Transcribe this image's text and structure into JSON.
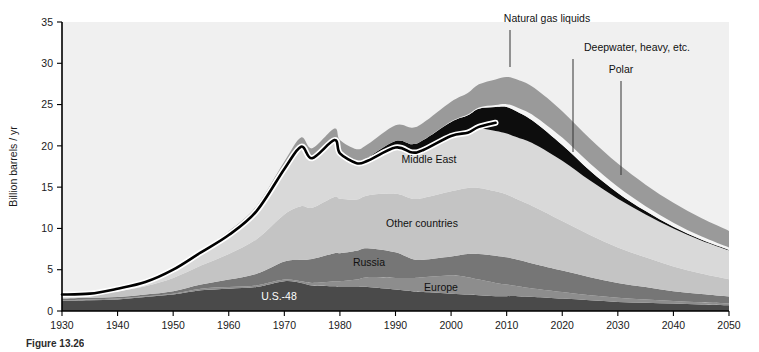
{
  "figure": {
    "caption_prefix": "Figure",
    "caption_number": "13.26",
    "y_axis_title": "Billion barrels / yr"
  },
  "chart_data": {
    "type": "area",
    "title": "",
    "subtitle": "",
    "xlabel": "",
    "ylabel": "Billion barrels / yr",
    "xlim": [
      1930,
      2050
    ],
    "ylim": [
      0,
      35
    ],
    "grid": false,
    "legend_position": "in-plot annotations",
    "stacked": true,
    "xticks": [
      1930,
      1940,
      1950,
      1960,
      1970,
      1980,
      1990,
      2000,
      2010,
      2020,
      2030,
      2040,
      2050
    ],
    "yticks": [
      0,
      5,
      10,
      15,
      20,
      25,
      30,
      35
    ],
    "x": [
      1930,
      1935,
      1940,
      1945,
      1950,
      1955,
      1960,
      1965,
      1970,
      1973,
      1975,
      1979,
      1980,
      1983,
      1985,
      1990,
      1993,
      1995,
      2000,
      2003,
      2005,
      2008,
      2010,
      2012,
      2015,
      2020,
      2025,
      2030,
      2035,
      2040,
      2045,
      2050
    ],
    "series": [
      {
        "name": "U.S.-48",
        "color": "#4a4a4a",
        "values": [
          1.2,
          1.3,
          1.4,
          1.7,
          2.0,
          2.5,
          2.7,
          2.9,
          3.6,
          3.4,
          3.1,
          3.0,
          2.9,
          2.9,
          2.9,
          2.6,
          2.4,
          2.3,
          2.1,
          2.0,
          1.9,
          1.8,
          1.8,
          1.8,
          1.7,
          1.5,
          1.3,
          1.1,
          1.0,
          0.9,
          0.8,
          0.7
        ]
      },
      {
        "name": "Europe",
        "color": "#8d8d8d",
        "values": [
          0.1,
          0.1,
          0.1,
          0.1,
          0.1,
          0.2,
          0.2,
          0.2,
          0.2,
          0.2,
          0.3,
          0.6,
          0.7,
          0.9,
          1.2,
          1.4,
          1.6,
          1.8,
          2.2,
          2.1,
          1.9,
          1.6,
          1.4,
          1.2,
          1.0,
          0.8,
          0.6,
          0.5,
          0.4,
          0.3,
          0.25,
          0.2
        ]
      },
      {
        "name": "Russia",
        "color": "#767676",
        "values": [
          0.2,
          0.2,
          0.2,
          0.2,
          0.3,
          0.5,
          0.9,
          1.4,
          2.2,
          2.6,
          2.9,
          3.4,
          3.4,
          3.5,
          3.5,
          3.1,
          2.3,
          2.1,
          2.3,
          2.8,
          3.1,
          3.3,
          3.3,
          3.2,
          3.0,
          2.6,
          2.2,
          1.8,
          1.5,
          1.2,
          1.0,
          0.85
        ]
      },
      {
        "name": "Other countries",
        "color": "#c4c4c4",
        "values": [
          0.4,
          0.5,
          0.7,
          1.0,
          1.6,
          2.3,
          3.1,
          4.2,
          5.7,
          6.5,
          6.2,
          6.8,
          6.6,
          6.2,
          6.4,
          7.1,
          7.3,
          7.5,
          7.9,
          8.0,
          8.0,
          7.8,
          7.6,
          7.3,
          6.9,
          6.0,
          5.1,
          4.3,
          3.6,
          3.0,
          2.5,
          2.1
        ]
      },
      {
        "name": "Middle East",
        "color": "#d9d9d9",
        "values": [
          0.1,
          0.2,
          0.3,
          0.5,
          1.0,
          1.6,
          2.3,
          3.4,
          5.5,
          7.2,
          6.0,
          6.8,
          5.5,
          4.4,
          4.2,
          5.6,
          5.6,
          5.8,
          6.7,
          6.7,
          7.2,
          7.3,
          7.4,
          7.5,
          7.6,
          7.3,
          6.6,
          5.9,
          5.2,
          4.6,
          4.0,
          3.5
        ]
      },
      {
        "name": "Deepwater, heavy, etc.",
        "color": "#0d0d0d",
        "values": [
          0,
          0,
          0,
          0,
          0,
          0,
          0,
          0,
          0,
          0,
          0,
          0,
          0.1,
          0.2,
          0.4,
          0.8,
          1.0,
          1.2,
          1.7,
          2.1,
          2.4,
          2.9,
          3.2,
          3.1,
          2.7,
          1.9,
          1.2,
          0.7,
          0.4,
          0.2,
          0.1,
          0.05
        ]
      },
      {
        "name": "Polar",
        "color": "#f5f5f5",
        "values": [
          0,
          0,
          0,
          0,
          0,
          0,
          0,
          0,
          0,
          0,
          0,
          0,
          0,
          0,
          0,
          0,
          0,
          0,
          0.05,
          0.1,
          0.15,
          0.25,
          0.35,
          0.5,
          0.7,
          0.9,
          0.85,
          0.75,
          0.6,
          0.5,
          0.4,
          0.3
        ]
      },
      {
        "name": "Natural gas liquids",
        "color": "#9a9a9a",
        "values": [
          0.05,
          0.05,
          0.1,
          0.15,
          0.2,
          0.3,
          0.45,
          0.6,
          0.9,
          1.1,
          1.2,
          1.5,
          1.5,
          1.5,
          1.6,
          1.9,
          2.0,
          2.1,
          2.4,
          2.6,
          2.8,
          3.1,
          3.3,
          3.4,
          3.4,
          3.2,
          3.0,
          2.8,
          2.6,
          2.4,
          2.2,
          2.0
        ]
      }
    ],
    "history_line": {
      "name": "Historical conventional oil production",
      "color": "#000000",
      "x": [
        1930,
        1935,
        1940,
        1945,
        1950,
        1955,
        1960,
        1965,
        1970,
        1973,
        1975,
        1979,
        1980,
        1983,
        1985,
        1990,
        1993,
        1995,
        2000,
        2003,
        2005,
        2008
      ],
      "values": [
        2.0,
        2.1,
        2.7,
        3.5,
        5.0,
        7.1,
        9.2,
        12.1,
        17.2,
        19.9,
        18.5,
        20.7,
        19.1,
        17.9,
        18.2,
        19.8,
        19.2,
        19.5,
        21.2,
        21.6,
        22.3,
        22.8
      ]
    },
    "annotations": [
      {
        "text": "Natural gas liquids",
        "type": "callout",
        "x": 2011,
        "label_xy": [
          547,
          22
        ],
        "leader_from": [
          510,
          30
        ],
        "leader_to": [
          510,
          67
        ]
      },
      {
        "text": "Deepwater, heavy, etc.",
        "type": "callout",
        "x": 2020,
        "label_xy": [
          637,
          51
        ],
        "leader_from": [
          573,
          59
        ],
        "leader_to": [
          573,
          152
        ]
      },
      {
        "text": "Polar",
        "type": "callout",
        "x": 2030,
        "label_xy": [
          621,
          73
        ],
        "leader_from": [
          621,
          81
        ],
        "leader_to": [
          621,
          175
        ]
      },
      {
        "text": "Middle East",
        "type": "inline",
        "label_xy": [
          429,
          163
        ]
      },
      {
        "text": "Other countries",
        "type": "inline",
        "label_xy": [
          422,
          227
        ]
      },
      {
        "text": "Russia",
        "type": "inline",
        "label_xy": [
          369,
          266
        ]
      },
      {
        "text": "Europe",
        "type": "inline",
        "label_xy": [
          441,
          291
        ]
      },
      {
        "text": "U.S.-48",
        "type": "inline-light",
        "label_xy": [
          279,
          300
        ]
      }
    ]
  }
}
